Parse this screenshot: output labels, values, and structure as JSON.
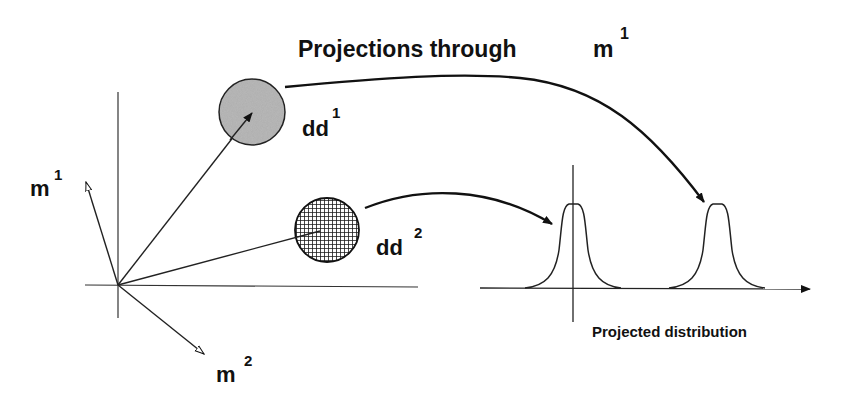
{
  "title": {
    "text": "Projections through",
    "symbol": "m",
    "superscript": "1"
  },
  "vectors": {
    "m1": {
      "base": "m",
      "superscript": "1"
    },
    "m2": {
      "base": "m",
      "superscript": "2"
    }
  },
  "distributions": {
    "dd1": {
      "base": "dd",
      "superscript": "1",
      "fill": "#b9b9b9",
      "pattern": "solid-gray"
    },
    "dd2": {
      "base": "dd",
      "superscript": "2",
      "fill": "#222222",
      "pattern": "crosshatch"
    }
  },
  "projection_axis": {
    "label": "Projected distribution"
  },
  "colors": {
    "ink": "#111111",
    "background": "#ffffff",
    "dd1_fill": "#b9b9b9"
  }
}
